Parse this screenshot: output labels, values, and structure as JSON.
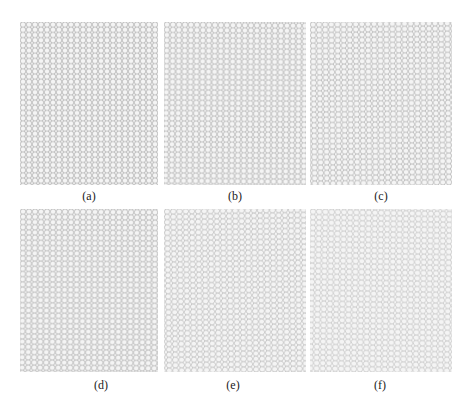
{
  "figure": {
    "panels": [
      {
        "id": "a",
        "caption": "(a)",
        "description": "hexagonal lattice, regular"
      },
      {
        "id": "b",
        "caption": "(b)",
        "description": "hexagonal lattice, slightly perturbed"
      },
      {
        "id": "c",
        "caption": "(c)",
        "description": "hexagonal lattice, perturbed"
      },
      {
        "id": "d",
        "caption": "(d)",
        "description": "hexagonal lattice, perturbed"
      },
      {
        "id": "e",
        "caption": "(e)",
        "description": "hexagonal lattice, more perturbed"
      },
      {
        "id": "f",
        "caption": "(f)",
        "description": "hexagonal lattice, most perturbed"
      }
    ],
    "colors": {
      "line": "#8a8a8a",
      "background": "#ffffff"
    }
  }
}
